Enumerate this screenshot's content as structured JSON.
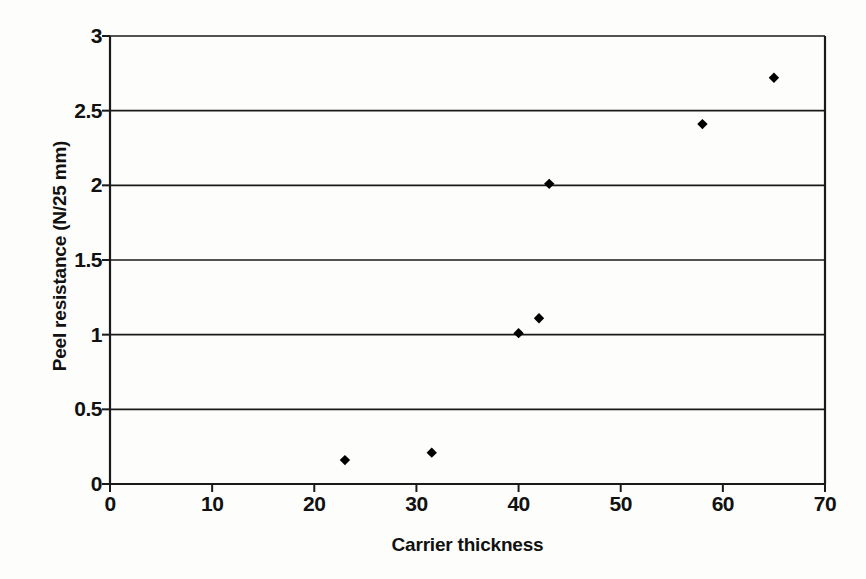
{
  "chart_data": {
    "type": "scatter",
    "title": "",
    "xlabel": "Carrier thickness",
    "ylabel": "Peel resistance (N/25 mm)",
    "xlim": [
      0,
      70
    ],
    "ylim": [
      0,
      3
    ],
    "xticks": [
      "0",
      "10",
      "20",
      "30",
      "40",
      "50",
      "60",
      "70"
    ],
    "xtick_values": [
      0,
      10,
      20,
      30,
      40,
      50,
      60,
      70
    ],
    "yticks": [
      "0",
      "0.5",
      "1",
      "1.5",
      "2",
      "2.5",
      "3"
    ],
    "ytick_values": [
      0,
      0.5,
      1,
      1.5,
      2,
      2.5,
      3
    ],
    "grid": "horizontal",
    "legend": "none",
    "marker": "diamond",
    "marker_color": "#000000",
    "series": [
      {
        "name": "Peel resistance vs carrier thickness",
        "points": [
          {
            "x": 23,
            "y": 0.16
          },
          {
            "x": 31.5,
            "y": 0.21
          },
          {
            "x": 40,
            "y": 1.01
          },
          {
            "x": 42,
            "y": 1.11
          },
          {
            "x": 43,
            "y": 2.01
          },
          {
            "x": 58,
            "y": 2.41
          },
          {
            "x": 65,
            "y": 2.72
          }
        ]
      }
    ]
  },
  "figure": {
    "background_color": "#fdfdfb",
    "axis_color": "#1a1a1a",
    "grid_color": "#1a1a1a"
  }
}
